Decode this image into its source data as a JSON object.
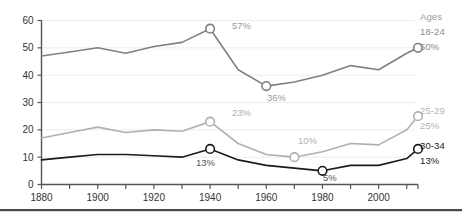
{
  "chart_data": {
    "type": "line",
    "title": "",
    "subtitle": "",
    "xlabel": "",
    "ylabel": "",
    "xlim": [
      1880,
      2014
    ],
    "ylim": [
      0,
      60
    ],
    "yticks": [
      0,
      10,
      20,
      30,
      40,
      50,
      60
    ],
    "ytick_labels": [
      "0",
      "10",
      "20",
      "30",
      "40",
      "50",
      "60"
    ],
    "xticks": [
      1880,
      1890,
      1900,
      1910,
      1920,
      1930,
      1940,
      1950,
      1960,
      1970,
      1980,
      1990,
      2000,
      2010
    ],
    "xtick_labels_shown": [
      "1880",
      "1900",
      "1920",
      "1940",
      "1960",
      "1980",
      "2000"
    ],
    "xtick_label_values": [
      1880,
      1900,
      1920,
      1940,
      1960,
      1980,
      2000
    ],
    "grid": true,
    "grid_axis": "y",
    "legend_position": "right",
    "legend_title": "Ages",
    "series": [
      {
        "name": "18-24",
        "color": "#808080",
        "end_label": "50%",
        "x": [
          1880,
          1890,
          1900,
          1910,
          1920,
          1930,
          1940,
          1950,
          1960,
          1970,
          1980,
          1990,
          2000,
          2010,
          2014
        ],
        "values": [
          47,
          48.5,
          50,
          48,
          50.5,
          52,
          57,
          42,
          36,
          37.5,
          40,
          43.5,
          42,
          48,
          50
        ],
        "annotations": [
          {
            "x": 1940,
            "y": 57,
            "label": "57%",
            "marker": true
          },
          {
            "x": 1960,
            "y": 36,
            "label": "36%",
            "marker": true
          },
          {
            "x": 2014,
            "y": 50,
            "label": "",
            "marker": true
          }
        ]
      },
      {
        "name": "25-29",
        "color": "#b0b0b0",
        "end_label": "25%",
        "x": [
          1880,
          1890,
          1900,
          1910,
          1920,
          1930,
          1940,
          1950,
          1960,
          1970,
          1980,
          1990,
          2000,
          2010,
          2014
        ],
        "values": [
          17,
          19,
          21,
          19,
          20,
          19.5,
          23,
          15,
          11,
          10,
          12,
          15,
          14.5,
          20,
          25
        ],
        "annotations": [
          {
            "x": 1940,
            "y": 23,
            "label": "23%",
            "marker": true
          },
          {
            "x": 1970,
            "y": 10,
            "label": "10%",
            "marker": true
          },
          {
            "x": 2014,
            "y": 25,
            "label": "",
            "marker": true
          }
        ]
      },
      {
        "name": "30-34",
        "color": "#1c1c1c",
        "end_label": "13%",
        "x": [
          1880,
          1890,
          1900,
          1910,
          1920,
          1930,
          1940,
          1950,
          1960,
          1970,
          1980,
          1990,
          2000,
          2010,
          2014
        ],
        "values": [
          9,
          10,
          11,
          11,
          10.5,
          10,
          13,
          9,
          7,
          6,
          5,
          7,
          7,
          9.5,
          13
        ],
        "annotations": [
          {
            "x": 1940,
            "y": 13,
            "label": "13%",
            "marker": true
          },
          {
            "x": 1980,
            "y": 5,
            "label": "5%",
            "marker": true
          },
          {
            "x": 2014,
            "y": 13,
            "label": "",
            "marker": true
          }
        ]
      }
    ],
    "callouts": [
      {
        "label": "57%",
        "series": "18-24",
        "x_px": 232,
        "y_px": 29,
        "color": "#9a9a9a"
      },
      {
        "label": "36%",
        "series": "18-24",
        "x_px": 267,
        "y_px": 101,
        "color": "#9a9a9a"
      },
      {
        "label": "23%",
        "series": "25-29",
        "x_px": 232,
        "y_px": 116,
        "color": "#b0b0b0"
      },
      {
        "label": "10%",
        "series": "25-29",
        "x_px": 298,
        "y_px": 144,
        "color": "#b0b0b0"
      },
      {
        "label": "13%",
        "series": "30-34",
        "x_px": 196,
        "y_px": 166,
        "color": "#555555"
      },
      {
        "label": "5%",
        "series": "30-34",
        "x_px": 323,
        "y_px": 181,
        "color": "#555555"
      }
    ]
  },
  "legend": {
    "title": "Ages",
    "entries": [
      {
        "name": "18-24",
        "value": "50%"
      },
      {
        "name": "25-29",
        "value": "25%"
      },
      {
        "name": "30-34",
        "value": "13%"
      }
    ]
  },
  "axis": {
    "y_labels": [
      "60",
      "50",
      "40",
      "30",
      "20",
      "10",
      "0"
    ],
    "x_labels": [
      "1880",
      "1900",
      "1920",
      "1940",
      "1960",
      "1980",
      "2000"
    ]
  },
  "colors": {
    "series_18_24": "#808080",
    "series_25_29": "#b0b0b0",
    "series_30_34": "#1c1c1c",
    "axis": "#555555",
    "grid": "#ececec",
    "tick_text": "#333333",
    "callout_text": "#999999"
  }
}
